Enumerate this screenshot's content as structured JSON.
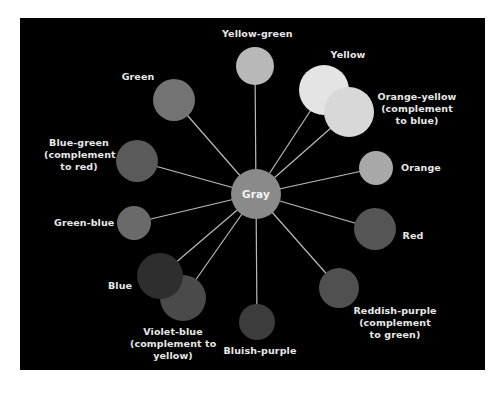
{
  "diagram": {
    "panel_color": "#000000",
    "line_color": "#bbbbbb",
    "center": {
      "label": "Gray",
      "cx": 256,
      "cy": 194,
      "r": 25,
      "color": "#8a8a8a"
    },
    "nodes": [
      {
        "id": "yellow-green",
        "label": "Yellow-green",
        "cx": 255,
        "cy": 66,
        "r": 19,
        "color": "#b8b8b8"
      },
      {
        "id": "yellow",
        "label": "Yellow",
        "cx": 324,
        "cy": 90,
        "r": 25,
        "color": "#e4e4e4"
      },
      {
        "id": "orange-yellow",
        "label": "Orange-yellow\n(complement\nto blue)",
        "cx": 349,
        "cy": 112,
        "r": 25,
        "color": "#d8d8d8"
      },
      {
        "id": "orange",
        "label": "Orange",
        "cx": 376,
        "cy": 168,
        "r": 17,
        "color": "#a8a8a8"
      },
      {
        "id": "red",
        "label": "Red",
        "cx": 375,
        "cy": 229,
        "r": 21,
        "color": "#555555"
      },
      {
        "id": "reddish-purple",
        "label": "Reddish-purple\n(complement\nto green)",
        "cx": 339,
        "cy": 288,
        "r": 20,
        "color": "#505050"
      },
      {
        "id": "bluish-purple",
        "label": "Bluish-purple",
        "cx": 257,
        "cy": 322,
        "r": 18,
        "color": "#3c3c3c"
      },
      {
        "id": "violet-blue",
        "label": "Violet-blue\n(complement to\nyellow)",
        "cx": 183,
        "cy": 298,
        "r": 23,
        "color": "#4a4a4a"
      },
      {
        "id": "blue",
        "label": "Blue",
        "cx": 160,
        "cy": 276,
        "r": 23,
        "color": "#2e2e2e"
      },
      {
        "id": "green-blue",
        "label": "Green-blue",
        "cx": 134,
        "cy": 223,
        "r": 17,
        "color": "#6a6a6a"
      },
      {
        "id": "blue-green",
        "label": "Blue-green\n(complement\nto red)",
        "cx": 137,
        "cy": 161,
        "r": 21,
        "color": "#5a5a5a"
      },
      {
        "id": "green",
        "label": "Green",
        "cx": 174,
        "cy": 100,
        "r": 21,
        "color": "#737373"
      }
    ],
    "labels": {
      "yellow_green": "Yellow-green",
      "yellow": "Yellow",
      "orange_yellow": "Orange-yellow\n(complement\nto blue)",
      "orange": "Orange",
      "red": "Red",
      "reddish_purple": "Reddish-purple\n(complement\nto green)",
      "bluish_purple": "Bluish-purple",
      "violet_blue": "Violet-blue\n(complement to\nyellow)",
      "blue": "Blue",
      "green_blue": "Green-blue",
      "blue_green": "Blue-green\n(complement\nto red)",
      "green": "Green",
      "gray": "Gray"
    }
  }
}
